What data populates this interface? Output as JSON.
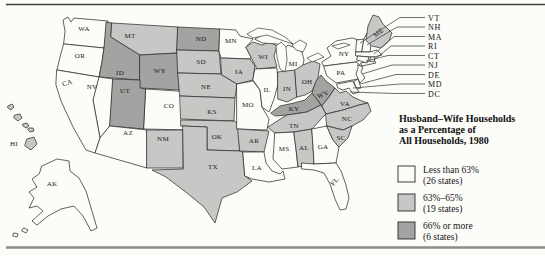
{
  "figure": {
    "title_lines": [
      "Husband–Wife Households",
      "as a Percentage of",
      "All Households, 1980"
    ]
  },
  "legend": {
    "items": [
      {
        "label": "Less than 63%",
        "sublabel": "(26 states)",
        "color": "#fcfcf9"
      },
      {
        "label": "63%–65%",
        "sublabel": "(19 states)",
        "color": "#c7c7c5"
      },
      {
        "label": "66% or more",
        "sublabel": "(6 states)",
        "color": "#a3a3a1"
      }
    ]
  },
  "callouts": {
    "labels": [
      "VT",
      "NH",
      "MA",
      "RI",
      "CT",
      "NJ",
      "DE",
      "MD",
      "DC"
    ]
  },
  "map": {
    "state_labels": [
      "WA",
      "OR",
      "CA",
      "NV",
      "ID",
      "MT",
      "WY",
      "UT",
      "CO",
      "AZ",
      "NM",
      "ND",
      "SD",
      "NE",
      "KS",
      "OK",
      "TX",
      "MN",
      "IA",
      "MO",
      "AR",
      "LA",
      "WI",
      "IL",
      "MI",
      "IN",
      "OH",
      "KY",
      "TN",
      "WV",
      "VA",
      "NC",
      "SC",
      "GA",
      "AL",
      "MS",
      "FL",
      "AK",
      "HI",
      "NY",
      "PA",
      "ME"
    ],
    "categories": {
      "less_than_63_pct": [
        "WA",
        "OR",
        "CA",
        "NV",
        "AZ",
        "CO",
        "AK",
        "MN",
        "MO",
        "IL",
        "MI",
        "LA",
        "MS",
        "GA",
        "FL",
        "NY",
        "PA",
        "VT",
        "NH",
        "MA",
        "RI",
        "CT",
        "NJ",
        "DE",
        "MD",
        "DC"
      ],
      "63_to_65_pct": [
        "MT",
        "SD",
        "NE",
        "KS",
        "IA",
        "WI",
        "NM",
        "OK",
        "TX",
        "AR",
        "TN",
        "AL",
        "NC",
        "SC",
        "IN",
        "OH",
        "VA",
        "ME",
        "HI"
      ],
      "66_pct_or_more": [
        "ID",
        "WY",
        "UT",
        "ND",
        "KY",
        "WV"
      ]
    }
  },
  "colors": {
    "background": "#fcfcf9",
    "category_low": "#fcfcf9",
    "category_mid": "#c7c7c5",
    "category_high": "#a3a3a1",
    "outline": "#2f2f2f"
  }
}
